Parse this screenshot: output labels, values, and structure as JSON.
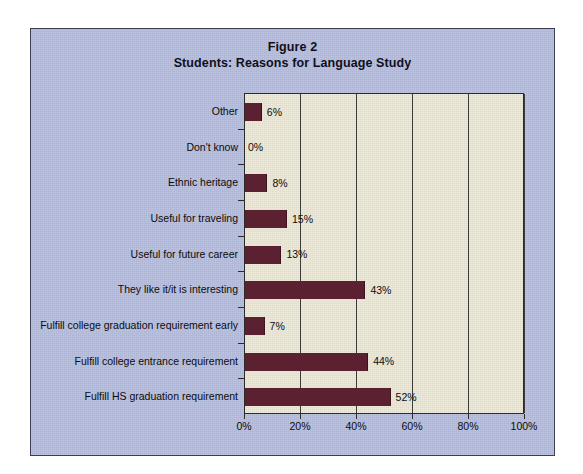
{
  "figure": {
    "title_line1": "Figure 2",
    "title_line2": "Students: Reasons for Language Study",
    "panel_color": "#b5bcdc",
    "plot_color": "#e9e5d4",
    "bar_color": "#5b2130",
    "grid_color": "#3b3b3b"
  },
  "chart_data": {
    "type": "bar",
    "orientation": "horizontal",
    "xlabel": "",
    "ylabel": "",
    "xlim": [
      0,
      100
    ],
    "grid": true,
    "legend": "none",
    "categories": [
      "Other",
      "Don't know",
      "Ethnic heritage",
      "Useful for traveling",
      "Useful for future career",
      "They like it/it is interesting",
      "Fulfill college graduation requirement early",
      "Fulfill college entrance requirement",
      "Fulfill HS graduation requirement"
    ],
    "values": [
      6,
      0,
      8,
      15,
      13,
      43,
      7,
      44,
      52
    ],
    "value_labels": [
      "6%",
      "0%",
      "8%",
      "15%",
      "13%",
      "43%",
      "7%",
      "44%",
      "52%"
    ],
    "x_ticks": [
      0,
      20,
      40,
      60,
      80,
      100
    ],
    "x_tick_labels": [
      "0%",
      "20%",
      "40%",
      "60%",
      "80%",
      "100%"
    ]
  }
}
